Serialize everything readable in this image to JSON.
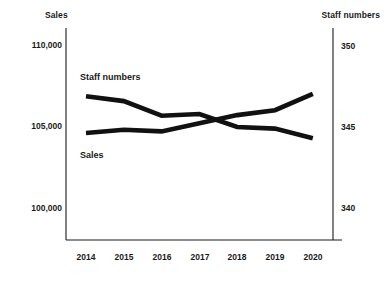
{
  "chart_data": {
    "type": "line",
    "title": "",
    "xlabel": "",
    "categories": [
      "2014",
      "2015",
      "2016",
      "2017",
      "2018",
      "2019",
      "2020"
    ],
    "x": [
      2014,
      2015,
      2016,
      2017,
      2018,
      2019,
      2020
    ],
    "grid": false,
    "legend_position": "in-plot annotations",
    "axes": {
      "left": {
        "label": "Sales",
        "ticks": [
          "110,000",
          "105,000",
          "100,000"
        ],
        "tick_values": [
          110000,
          105000,
          100000
        ],
        "ylim": [
          98000,
          112000
        ]
      },
      "right": {
        "label": "Staff numbers",
        "ticks": [
          "350",
          "345",
          "340"
        ],
        "tick_values": [
          350,
          345,
          340
        ],
        "ylim": [
          338,
          352
        ]
      }
    },
    "series": [
      {
        "name": "Staff numbers",
        "axis": "right",
        "annotation": "Staff numbers",
        "values": [
          346.9,
          346.6,
          345.7,
          345.8,
          345.0,
          344.9,
          344.3
        ]
      },
      {
        "name": "Sales",
        "axis": "left",
        "annotation": "Sales",
        "values": [
          104600,
          104800,
          104700,
          105200,
          105700,
          106000,
          107000
        ]
      }
    ]
  },
  "plot": {
    "left_axis_title": "Sales",
    "right_axis_title": "Staff numbers",
    "series_annotation_staff": "Staff numbers",
    "series_annotation_sales": "Sales",
    "left_ticks": [
      {
        "label": "110,000"
      },
      {
        "label": "105,000"
      },
      {
        "label": "100,000"
      }
    ],
    "right_ticks": [
      {
        "label": "350"
      },
      {
        "label": "345"
      },
      {
        "label": "340"
      }
    ],
    "x_ticks": [
      {
        "label": "2014"
      },
      {
        "label": "2015"
      },
      {
        "label": "2016"
      },
      {
        "label": "2017"
      },
      {
        "label": "2018"
      },
      {
        "label": "2019"
      },
      {
        "label": "2020"
      }
    ],
    "colors": {
      "line": "#111111",
      "axis": "#1a1a1a",
      "background": "#ffffff"
    }
  }
}
